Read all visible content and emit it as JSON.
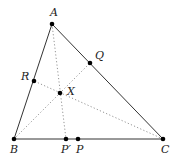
{
  "diagram": {
    "type": "triangle-cevians",
    "points": {
      "A": {
        "x": 52,
        "y": 24,
        "label": "A",
        "label_dx": -2,
        "label_dy": -8
      },
      "B": {
        "x": 14,
        "y": 139,
        "label": "B",
        "label_dx": -4,
        "label_dy": 14
      },
      "C": {
        "x": 163,
        "y": 139,
        "label": "C",
        "label_dx": -2,
        "label_dy": 14
      },
      "P_prime": {
        "x": 66,
        "y": 139,
        "label": "P′",
        "label_dx": -5,
        "label_dy": 14
      },
      "P": {
        "x": 78,
        "y": 139,
        "label": "P",
        "label_dx": -2,
        "label_dy": 14
      },
      "Q": {
        "x": 90,
        "y": 63,
        "label": "Q",
        "label_dx": 5,
        "label_dy": -4
      },
      "R": {
        "x": 34,
        "y": 81,
        "label": "R",
        "label_dx": -13,
        "label_dy": -1
      },
      "X": {
        "x": 60,
        "y": 93,
        "label": "X",
        "label_dx": 7,
        "label_dy": 2
      }
    },
    "sides": [
      [
        "A",
        "B"
      ],
      [
        "B",
        "C"
      ],
      [
        "C",
        "A"
      ]
    ],
    "cevians": [
      [
        "A",
        "P_prime"
      ],
      [
        "B",
        "Q"
      ],
      [
        "C",
        "R"
      ]
    ]
  }
}
